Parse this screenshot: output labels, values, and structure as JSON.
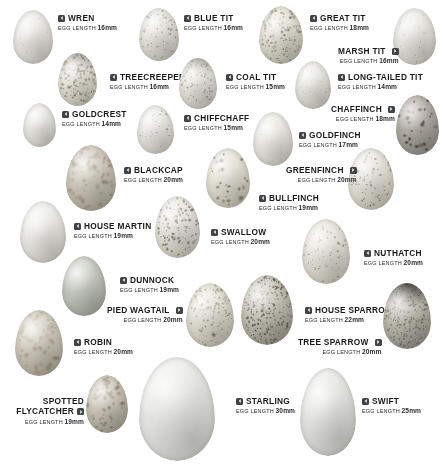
{
  "chart": {
    "length_label": "EGG LENGTH",
    "width": 443,
    "height": 476,
    "background": "#ffffff",
    "marker_color": "#3f4246",
    "text_color": "#16181b"
  },
  "entries": [
    {
      "id": "wren",
      "name": "WREN",
      "length": "16mm",
      "arrow": "left",
      "label_x": 58,
      "label_y": 14,
      "align": "left",
      "egg": {
        "x": 13,
        "y": 10,
        "w": 40,
        "h": 54,
        "base": "#f2f1ec",
        "edge": "#dcdad2",
        "spot_color": "rgba(120,104,82,0.40)",
        "density": "faint",
        "cap": "none"
      }
    },
    {
      "id": "blue-tit",
      "name": "BLUE TIT",
      "length": "16mm",
      "arrow": "left",
      "label_x": 184,
      "label_y": 14,
      "align": "left",
      "egg": {
        "x": 139,
        "y": 8,
        "w": 40,
        "h": 53,
        "base": "#efeee7",
        "edge": "#d4d1c6",
        "spot_color": "rgba(96,72,48,0.62)",
        "density": "medium",
        "cap": "none"
      }
    },
    {
      "id": "great-tit",
      "name": "GREAT TIT",
      "length": "18mm",
      "arrow": "left",
      "label_x": 310,
      "label_y": 14,
      "align": "left",
      "egg": {
        "x": 259,
        "y": 6,
        "w": 44,
        "h": 58,
        "base": "#eceadf",
        "edge": "#cdc9ba",
        "spot_color": "rgba(84,62,42,0.72)",
        "density": "heavy",
        "cap": "none"
      }
    },
    {
      "id": "marsh-tit",
      "name": "MARSH TIT",
      "length": "16mm",
      "arrow": "right",
      "label_x": 338,
      "label_y": 47,
      "align": "right",
      "egg": {
        "x": 393,
        "y": 8,
        "w": 43,
        "h": 57,
        "base": "#f1f0ea",
        "edge": "#d8d5cb",
        "spot_color": "rgba(110,88,62,0.45)",
        "density": "light",
        "cap": "none"
      }
    },
    {
      "id": "treecreeper",
      "name": "TREECREEPER",
      "length": "16mm",
      "arrow": "left",
      "label_x": 110,
      "label_y": 73,
      "align": "left",
      "egg": {
        "x": 58,
        "y": 53,
        "w": 39,
        "h": 53,
        "base": "#eeece3",
        "edge": "#d2cec0",
        "spot_color": "rgba(92,68,44,0.66)",
        "density": "heavy",
        "cap": "top"
      }
    },
    {
      "id": "coal-tit",
      "name": "COAL TIT",
      "length": "15mm",
      "arrow": "left",
      "label_x": 226,
      "label_y": 73,
      "align": "left",
      "egg": {
        "x": 179,
        "y": 58,
        "w": 38,
        "h": 51,
        "base": "#f0efe8",
        "edge": "#d6d3c8",
        "spot_color": "rgba(96,72,48,0.60)",
        "density": "medium",
        "cap": "top"
      }
    },
    {
      "id": "long-tailed-tit",
      "name": "LONG-TAILED TIT",
      "length": "14mm",
      "arrow": "left",
      "label_x": 338,
      "label_y": 73,
      "align": "left",
      "egg": {
        "x": 295,
        "y": 61,
        "w": 36,
        "h": 48,
        "base": "#f1f0ea",
        "edge": "#d9d6cc",
        "spot_color": "rgba(118,96,70,0.42)",
        "density": "light",
        "cap": "none"
      }
    },
    {
      "id": "goldcrest",
      "name": "GOLDCREST",
      "length": "14mm",
      "arrow": "left",
      "label_x": 62,
      "label_y": 110,
      "align": "left",
      "egg": {
        "x": 23,
        "y": 103,
        "w": 33,
        "h": 44,
        "base": "#f3f2ed",
        "edge": "#dedbd2",
        "spot_color": "rgba(128,106,80,0.28)",
        "density": "faint",
        "cap": "none"
      }
    },
    {
      "id": "chiffchaff",
      "name": "CHIFFCHAFF",
      "length": "15mm",
      "arrow": "left",
      "label_x": 184,
      "label_y": 114,
      "align": "left",
      "egg": {
        "x": 137,
        "y": 105,
        "w": 37,
        "h": 49,
        "base": "#f3f2ed",
        "edge": "#dbd8ce",
        "spot_color": "rgba(84,60,40,0.58)",
        "density": "light",
        "cap": "none"
      }
    },
    {
      "id": "chaffinch",
      "name": "CHAFFINCH",
      "length": "18mm",
      "arrow": "right",
      "label_x": 331,
      "label_y": 105,
      "align": "right",
      "egg": {
        "x": 396,
        "y": 95,
        "w": 43,
        "h": 60,
        "base": "#b9b4ac",
        "edge": "#8e8981",
        "spot_color": "rgba(22,20,18,0.90)",
        "density": "blotch",
        "cap": "none"
      }
    },
    {
      "id": "goldfinch",
      "name": "GOLDFINCH",
      "length": "17mm",
      "arrow": "left",
      "label_x": 299,
      "label_y": 131,
      "align": "left",
      "egg": {
        "x": 253,
        "y": 112,
        "w": 40,
        "h": 54,
        "base": "#f3f2ec",
        "edge": "#dcd9cf",
        "spot_color": "rgba(110,86,58,0.42)",
        "density": "faint",
        "cap": "none"
      }
    },
    {
      "id": "blackcap",
      "name": "BLACKCAP",
      "length": "20mm",
      "arrow": "left",
      "label_x": 124,
      "label_y": 166,
      "align": "left",
      "egg": {
        "x": 66,
        "y": 145,
        "w": 50,
        "h": 66,
        "base": "#d8d2c4",
        "edge": "#b2ab9b",
        "spot_color": "rgba(108,92,68,0.40)",
        "density": "mottle",
        "cap": "none"
      }
    },
    {
      "id": "greenfinch",
      "name": "GREENFINCH",
      "length": "20mm",
      "arrow": "right",
      "label_x": 286,
      "label_y": 166,
      "align": "right",
      "egg": {
        "x": 348,
        "y": 148,
        "w": 46,
        "h": 62,
        "base": "#eeece4",
        "edge": "#d3cfc2",
        "spot_color": "rgba(82,62,44,0.72)",
        "density": "medium",
        "cap": "none"
      }
    },
    {
      "id": "bullfinch",
      "name": "BULLFINCH",
      "length": "19mm",
      "arrow": "left",
      "label_x": 259,
      "label_y": 194,
      "align": "left",
      "egg": {
        "x": 206,
        "y": 148,
        "w": 44,
        "h": 60,
        "base": "#edeae0",
        "edge": "#cfcabb",
        "spot_color": "rgba(58,48,38,0.82)",
        "density": "blotch",
        "cap": "none"
      }
    },
    {
      "id": "house-martin",
      "name": "HOUSE MARTIN",
      "length": "19mm",
      "arrow": "left",
      "label_x": 74,
      "label_y": 222,
      "align": "left",
      "egg": {
        "x": 20,
        "y": 201,
        "w": 46,
        "h": 62,
        "base": "#f4f3ee",
        "edge": "#dfdcd3",
        "spot_color": "rgba(140,126,104,0.16)",
        "density": "none",
        "cap": "none"
      }
    },
    {
      "id": "swallow",
      "name": "SWALLOW",
      "length": "20mm",
      "arrow": "left",
      "label_x": 211,
      "label_y": 228,
      "align": "left",
      "egg": {
        "x": 155,
        "y": 196,
        "w": 45,
        "h": 62,
        "base": "#f0efe8",
        "edge": "#d4d1c5",
        "spot_color": "rgba(74,54,36,0.76)",
        "density": "heavy",
        "cap": "none"
      }
    },
    {
      "id": "nuthatch",
      "name": "NUTHATCH",
      "length": "20mm",
      "arrow": "left",
      "label_x": 364,
      "label_y": 249,
      "align": "left",
      "egg": {
        "x": 302,
        "y": 219,
        "w": 48,
        "h": 65,
        "base": "#efede5",
        "edge": "#d3cfc3",
        "spot_color": "rgba(96,70,48,0.66)",
        "density": "medium",
        "cap": "none"
      }
    },
    {
      "id": "dunnock",
      "name": "DUNNOCK",
      "length": "19mm",
      "arrow": "left",
      "label_x": 120,
      "label_y": 276,
      "align": "left",
      "egg": {
        "x": 62,
        "y": 256,
        "w": 44,
        "h": 60,
        "base": "#cfd3c9",
        "edge": "#a7ada0",
        "spot_color": "rgba(130,138,126,0.12)",
        "density": "none",
        "cap": "none"
      }
    },
    {
      "id": "pied-wagtail",
      "name": "PIED WAGTAIL",
      "length": "20mm",
      "arrow": "right",
      "label_x": 107,
      "label_y": 306,
      "align": "right",
      "egg": {
        "x": 186,
        "y": 283,
        "w": 48,
        "h": 64,
        "base": "#eceadf",
        "edge": "#ccc7b8",
        "spot_color": "rgba(92,74,52,0.58)",
        "density": "heavy",
        "cap": "none"
      }
    },
    {
      "id": "house-sparrow",
      "name": "HOUSE SPARROW",
      "length": "22mm",
      "arrow": "left",
      "label_x": 305,
      "label_y": 306,
      "align": "left",
      "egg": {
        "x": 241,
        "y": 275,
        "w": 52,
        "h": 70,
        "base": "#d2cec2",
        "edge": "#9c988c",
        "spot_color": "rgba(38,34,28,0.80)",
        "density": "dense",
        "cap": "none"
      }
    },
    {
      "id": "robin",
      "name": "ROBIN",
      "length": "20mm",
      "arrow": "left",
      "label_x": 74,
      "label_y": 338,
      "align": "left",
      "egg": {
        "x": 15,
        "y": 310,
        "w": 48,
        "h": 66,
        "base": "#dcd6c8",
        "edge": "#b3ac9b",
        "spot_color": "rgba(122,100,72,0.36)",
        "density": "mottle",
        "cap": "none"
      }
    },
    {
      "id": "tree-sparrow",
      "name": "TREE SPARROW",
      "length": "20mm",
      "arrow": "right",
      "label_x": 298,
      "label_y": 338,
      "align": "right",
      "egg": {
        "x": 383,
        "y": 283,
        "w": 48,
        "h": 66,
        "base": "#c9c5b9",
        "edge": "#97938a",
        "spot_color": "rgba(52,48,42,0.60)",
        "density": "dense",
        "cap": "dark"
      }
    },
    {
      "id": "spotted-flycatcher",
      "name": "SPOTTED FLYCATCHER",
      "length": "19mm",
      "arrow": "right",
      "label_x": 12,
      "label_y": 396,
      "align": "right",
      "egg": {
        "x": 86,
        "y": 375,
        "w": 42,
        "h": 58,
        "base": "#d7d1c3",
        "edge": "#aaa394",
        "spot_color": "rgba(104,84,58,0.52)",
        "density": "mottle",
        "cap": "none"
      }
    },
    {
      "id": "starling",
      "name": "STARLING",
      "length": "30mm",
      "arrow": "left",
      "label_x": 236,
      "label_y": 397,
      "align": "left",
      "egg": {
        "x": 139,
        "y": 357,
        "w": 76,
        "h": 104,
        "base": "#f0f1ee",
        "edge": "#d7d9d4",
        "spot_color": "rgba(150,152,148,0.08)",
        "density": "none",
        "cap": "none"
      }
    },
    {
      "id": "swift",
      "name": "SWIFT",
      "length": "25mm",
      "arrow": "left",
      "label_x": 362,
      "label_y": 397,
      "align": "left",
      "egg": {
        "x": 300,
        "y": 368,
        "w": 56,
        "h": 88,
        "base": "#eeefeb",
        "edge": "#d5d7d1",
        "spot_color": "rgba(150,152,148,0.08)",
        "density": "none",
        "cap": "none"
      }
    }
  ]
}
